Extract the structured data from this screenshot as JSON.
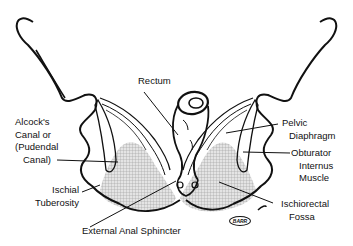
{
  "diagram": {
    "colors": {
      "line": "#111111",
      "hatch_fill": "#cccccc",
      "background": "#ffffff"
    },
    "labels": {
      "rectum": "Rectum",
      "alcocks_canal": [
        "Alcock's",
        "Canal or",
        "(Pudendal",
        "Canal)"
      ],
      "ischial_tuberosity": [
        "Ischial",
        "Tuberosity"
      ],
      "external_anal_sphincter": "External Anal Sphincter",
      "pelvic_diaphragm": [
        "Pelvic",
        "Diaphragm"
      ],
      "obturator_internus": [
        "Obturator",
        "Internus",
        "Muscle"
      ],
      "ischiorectal_fossa": [
        "Ischiorectal",
        "Fossa"
      ]
    },
    "signature": "BARR"
  }
}
